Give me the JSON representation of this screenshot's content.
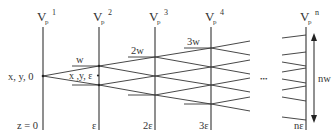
{
  "diagram": {
    "columns": [
      {
        "label": "V",
        "sub": "p",
        "sup": "1",
        "z": "z = 0"
      },
      {
        "label": "V",
        "sub": "p",
        "sup": "2",
        "z": "ε"
      },
      {
        "label": "V",
        "sub": "p",
        "sup": "3",
        "z": "2ε"
      },
      {
        "label": "V",
        "sub": "p",
        "sup": "4",
        "z": "3ε"
      },
      {
        "label": "V",
        "sub": "p",
        "sup": "n",
        "z": "nε"
      }
    ],
    "source_label": "x, y, 0",
    "point_label": "x ,y, ε",
    "width_labels": [
      "w",
      "2w",
      "3w"
    ],
    "ellipsis": "•••",
    "total_width_label": "nw",
    "line_color": "#333333"
  }
}
